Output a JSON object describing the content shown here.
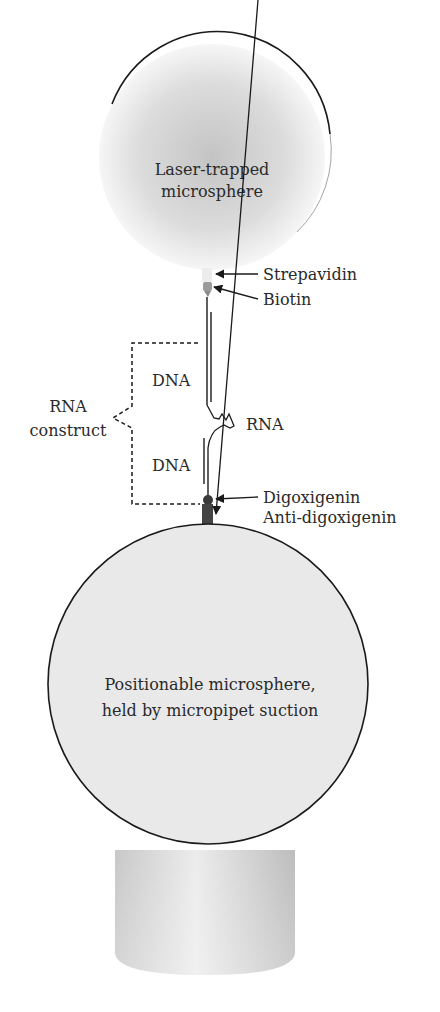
{
  "figure": {
    "top_sphere": {
      "label_line1": "Laser-trapped",
      "label_line2": "microsphere"
    },
    "bottom_sphere": {
      "label_line1": "Positionable microsphere,",
      "label_line2": "held by micropipet suction"
    },
    "callouts": {
      "strepavidin": "Strepavidin",
      "biotin": "Biotin",
      "digoxigenin": "Digoxigenin",
      "anti_digoxigenin": "Anti-digoxigenin"
    },
    "strands": {
      "dna_upper": "DNA",
      "rna": "RNA",
      "dna_lower": "DNA"
    },
    "bracket": {
      "label_line1": "RNA",
      "label_line2": "construct"
    }
  },
  "colors": {
    "outline": "#1a1a1a",
    "sphere_fill": "#e9e9e9",
    "top_sphere_center": "#c9c9c9",
    "biotin": "#9a9a9a",
    "digoxigenin": "#3a3a3a",
    "anti_digoxigenin": "#444444",
    "pipet": "#d6d6d6"
  }
}
